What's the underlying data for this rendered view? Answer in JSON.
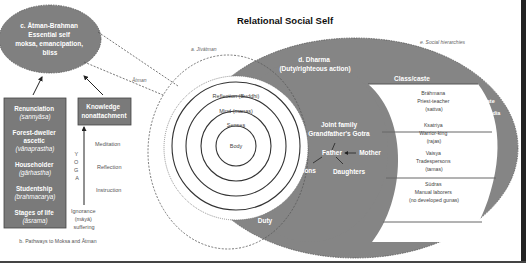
{
  "title": "Relational Social Self",
  "colors": {
    "gray_fill": "#808080",
    "box_fill": "#7a7a7a",
    "white": "#ffffff",
    "text_dark": "#333333",
    "text_light": "#666666",
    "border": "#222222"
  },
  "atman_brahman": {
    "lines": [
      "c. Ātman-Brahman",
      "Essential self",
      "moksa, emancipation,",
      "bliss"
    ]
  },
  "atman_label": "Ātman",
  "jivatman_label": "a. Jīvātman",
  "social_hierarchies_label": "e. Social hierarchies",
  "dharma": {
    "lines": [
      "d. Dharma",
      "(Duty/righteous action)"
    ],
    "duty_label": "Duty"
  },
  "circles": [
    "Reflection (Buddhi)",
    "Mind (manas)",
    "Senses",
    "Body"
  ],
  "family": {
    "line1": "Joint family",
    "line2": "Grandfather's Gotra",
    "father": "Father",
    "mother": "Mother",
    "sons": "Sons",
    "daughters": "Daughters"
  },
  "caste": {
    "header": "Class/caste",
    "rows": [
      [
        "Brāhmana",
        "Priest-teacher",
        "(sattva)"
      ],
      [
        "Ksatriya",
        "Warrior-king",
        "(rajas)"
      ],
      [
        "Vaisya",
        "Tradespersons",
        "(tamas)"
      ],
      [
        "Sūdras",
        "Manual laborers",
        "(no developed gunas)"
      ]
    ]
  },
  "state_label": "State",
  "india_label": "India",
  "stages": {
    "items": [
      [
        "Renunciation",
        "(sannyāsa)"
      ],
      [
        "Forest-dweller",
        "ascetic",
        "(vānaprastha)"
      ],
      [
        "Householder",
        "(gārhastha)"
      ],
      [
        "Studentship",
        "(brahmacarya)"
      ],
      [
        "Stages of life",
        "(āsrama)"
      ]
    ]
  },
  "knowledge": {
    "lines": [
      "Knowledge",
      "nonattachment"
    ]
  },
  "yoga": [
    "Y",
    "O",
    "G",
    "A"
  ],
  "yoga_steps": [
    "Meditation",
    "Reflection",
    "Instruction"
  ],
  "ignorance": [
    "Ignorance",
    "(māyā)",
    "suffering"
  ],
  "pathways_caption": "b. Pathways to Moksa and Ātman"
}
